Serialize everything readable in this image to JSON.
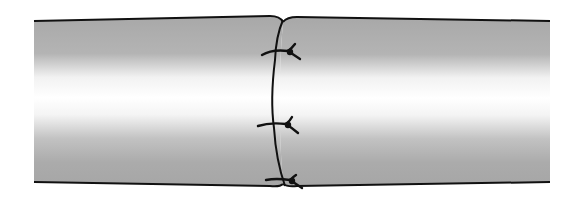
{
  "figure": {
    "subject": "end-to-end anastomosis with interrupted sutures",
    "segments": [
      {
        "name": "left-segment"
      },
      {
        "name": "right-segment"
      }
    ],
    "suture_count": 3,
    "colors": {
      "background": "#ffffff",
      "tube_shadow": "#a9a9a9",
      "tube_highlight": "#ffffff",
      "outline": "#111111"
    }
  }
}
